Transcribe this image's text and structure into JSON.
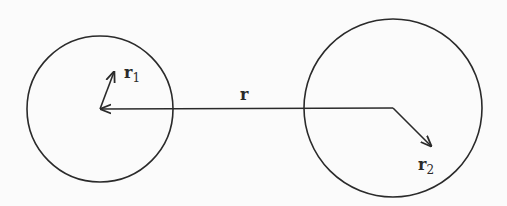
{
  "diagram": {
    "colors": {
      "stroke": "#2a2a2a",
      "background": "#fbfbfb"
    },
    "circles": [
      {
        "name": "sphere-1",
        "cx": 100,
        "cy": 109,
        "r": 73
      },
      {
        "name": "sphere-2",
        "cx": 393,
        "cy": 108,
        "r": 89
      }
    ],
    "vectors": [
      {
        "name": "r",
        "from": [
          393,
          108
        ],
        "to": [
          101,
          109
        ]
      },
      {
        "name": "r1",
        "from": [
          100,
          109
        ],
        "to": [
          114,
          72
        ]
      },
      {
        "name": "r2",
        "from": [
          393,
          108
        ],
        "to": [
          431,
          146
        ]
      }
    ],
    "labels": {
      "r": {
        "text": "r",
        "sub": "",
        "x": 240,
        "y": 100
      },
      "r1": {
        "text": "r",
        "sub": "1",
        "x": 124,
        "y": 78
      },
      "r2": {
        "text": "r",
        "sub": "2",
        "x": 418,
        "y": 170
      }
    }
  }
}
